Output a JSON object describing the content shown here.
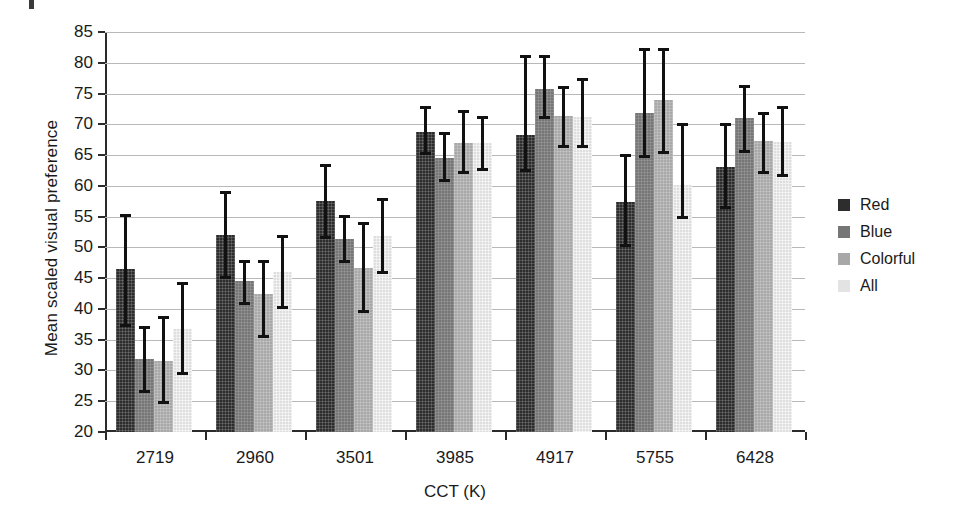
{
  "chart_data": {
    "type": "bar",
    "title": "",
    "xlabel": "CCT (K)",
    "ylabel": "Mean scaled visual preference",
    "categories": [
      "2719",
      "2960",
      "3501",
      "3985",
      "4917",
      "5755",
      "6428"
    ],
    "ylim": [
      20,
      85
    ],
    "yticks": [
      20,
      25,
      30,
      35,
      40,
      45,
      50,
      55,
      60,
      65,
      70,
      75,
      80,
      85
    ],
    "grid": true,
    "legend_position": "right",
    "error_bars": "vertical, capped",
    "series": [
      {
        "name": "Red",
        "color": "#2d2d2d",
        "values": [
          46.5,
          52.0,
          57.5,
          68.8,
          68.2,
          57.4,
          63.0
        ],
        "err_low": [
          37.0,
          44.8,
          51.4,
          65.0,
          62.2,
          50.0,
          56.2
        ],
        "err_high": [
          55.4,
          59.2,
          63.6,
          73.0,
          81.2,
          65.2,
          70.2
        ]
      },
      {
        "name": "Blue",
        "color": "#767676",
        "values": [
          31.8,
          44.5,
          51.3,
          64.6,
          75.8,
          71.8,
          71.0
        ],
        "err_low": [
          26.4,
          40.6,
          47.4,
          60.6,
          70.8,
          64.5,
          65.4
        ],
        "err_high": [
          37.2,
          48.0,
          55.2,
          68.8,
          81.2,
          82.4,
          76.4
        ]
      },
      {
        "name": "Colorful",
        "color": "#a8a8a8",
        "values": [
          31.5,
          42.5,
          46.7,
          66.9,
          71.3,
          74.0,
          67.3
        ],
        "err_low": [
          24.5,
          35.2,
          39.4,
          62.0,
          66.2,
          65.2,
          62.0
        ],
        "err_high": [
          38.8,
          48.0,
          54.2,
          72.4,
          76.2,
          82.4,
          72.0
        ]
      },
      {
        "name": "All",
        "color": "#dedede",
        "values": [
          36.7,
          46.0,
          51.8,
          67.0,
          71.2,
          60.2,
          67.2
        ],
        "err_low": [
          29.2,
          40.0,
          45.6,
          62.4,
          66.2,
          54.6,
          61.4
        ],
        "err_high": [
          44.4,
          52.0,
          58.0,
          71.4,
          77.6,
          70.2,
          73.0
        ]
      }
    ]
  },
  "legend": {
    "items": [
      {
        "label": "Red",
        "swatch": "red"
      },
      {
        "label": "Blue",
        "swatch": "blue"
      },
      {
        "label": "Colorful",
        "swatch": "colorful"
      },
      {
        "label": "All",
        "swatch": "all"
      }
    ]
  }
}
